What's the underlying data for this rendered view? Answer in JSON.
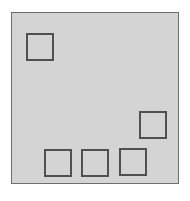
{
  "board": {
    "background": "#d4d4d4",
    "border_color": "#6e6e6e"
  },
  "squares": [
    {
      "id": "top-left",
      "x": 26,
      "y": 33
    },
    {
      "id": "right-middle",
      "x": 139,
      "y": 111
    },
    {
      "id": "bottom-1",
      "x": 44,
      "y": 149
    },
    {
      "id": "bottom-2",
      "x": 81,
      "y": 149
    },
    {
      "id": "bottom-3",
      "x": 119,
      "y": 148
    }
  ],
  "square_border_color": "#505050"
}
